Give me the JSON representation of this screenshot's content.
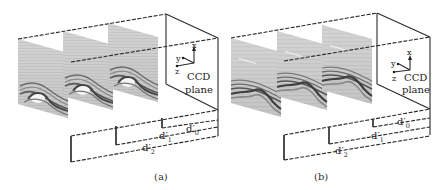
{
  "figure": {
    "panels": [
      {
        "id": "a",
        "caption": "(a)",
        "sensor_label_line1": "CCD",
        "sensor_label_line2": "plane",
        "axes": {
          "x": "x",
          "y": "y",
          "z": "z"
        },
        "distances": [
          {
            "base": "d′",
            "sub": "0"
          },
          {
            "base": "d′",
            "sub": "1"
          },
          {
            "base": "d′",
            "sub": "2"
          }
        ],
        "hologram_planes": 3,
        "description": "Reconstructed image planes at distances d′0, d′1, d′2 from CCD plane; fringe detail increases toward far plane"
      },
      {
        "id": "b",
        "caption": "(b)",
        "sensor_label_line1": "CCD",
        "sensor_label_line2": "plane",
        "axes": {
          "x": "x",
          "y": "y",
          "z": "z"
        },
        "distances": [
          {
            "base": "d′",
            "sub": "0"
          },
          {
            "base": "d′",
            "sub": "1"
          },
          {
            "base": "d′",
            "sub": "2"
          }
        ],
        "hologram_planes": 3,
        "description": "Reconstructed image planes with smoother fringe patterns at distances d′0, d′1, d′2"
      }
    ],
    "colors": {
      "line": "#2a2a2a",
      "plane_fill": "#cfcfcf",
      "fringe_dark": "#555555",
      "background": "#ffffff"
    }
  }
}
